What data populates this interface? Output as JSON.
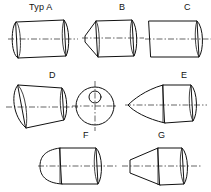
{
  "drawing": {
    "title": "Workpiece end forms Typ A to G",
    "line_color": "#111111",
    "center_line_color": "#222222",
    "background": "#ffffff",
    "figure_count": 7
  },
  "labels": {
    "a": "Typ A",
    "b": "B",
    "c": "C",
    "d": "D",
    "e": "E",
    "f": "F",
    "g": "G"
  },
  "figures": [
    {
      "id": "a",
      "label": "Typ A",
      "description": "cylinder with elliptical ends, both ends square",
      "row": 1,
      "column": 1
    },
    {
      "id": "b",
      "label": "B",
      "description": "cylinder with short chamfered conical left end",
      "row": 1,
      "column": 2
    },
    {
      "id": "c",
      "label": "C",
      "description": "cylinder with flat square cut left end",
      "row": 1,
      "column": 3
    },
    {
      "id": "d",
      "label": "D",
      "description": "cylinder with obliquely cut angled left end",
      "row": 2,
      "column": 1
    },
    {
      "id": "end-view",
      "label": "",
      "description": "circular end view with small bore circle above centre and crosshair centre lines",
      "row": 2,
      "column": 2
    },
    {
      "id": "e",
      "label": "E",
      "description": "cylinder with long pointed conical nose",
      "row": 2,
      "column": 3
    },
    {
      "id": "f",
      "label": "F",
      "description": "cylinder with hemispherical rounded left end",
      "row": 3,
      "column": 1
    },
    {
      "id": "g",
      "label": "G",
      "description": "cylinder with truncated cone tapered left end",
      "row": 3,
      "column": 2
    }
  ]
}
